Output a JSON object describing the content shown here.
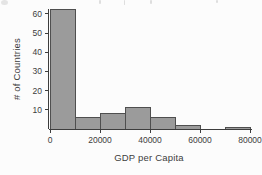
{
  "figure": {
    "background": "#fcfcfc",
    "text_color": "#3d3d3d"
  },
  "chart_data": {
    "type": "bar",
    "subtype": "histogram",
    "title": "",
    "xlabel": "GDP per Capita",
    "ylabel": "# of Countries",
    "bin_edges": [
      0,
      10000,
      20000,
      30000,
      40000,
      50000,
      60000,
      70000,
      80000
    ],
    "values": [
      62,
      6,
      8,
      11,
      6,
      2,
      0,
      1
    ],
    "x_ticks": [
      0,
      20000,
      40000,
      60000,
      80000
    ],
    "x_tick_labels": [
      "0",
      "20000",
      "40000",
      "60000",
      "80000"
    ],
    "y_ticks": [
      10,
      20,
      30,
      40,
      50,
      60
    ],
    "y_tick_labels": [
      "10",
      "20",
      "30",
      "40",
      "50",
      "60"
    ],
    "xlim": [
      0,
      80000
    ],
    "ylim": [
      0,
      65
    ],
    "grid": false,
    "legend": null,
    "bar_fill": "#9b9b9b",
    "bar_stroke": "#4f4f4f",
    "axis_color": "#3d3d3d"
  }
}
